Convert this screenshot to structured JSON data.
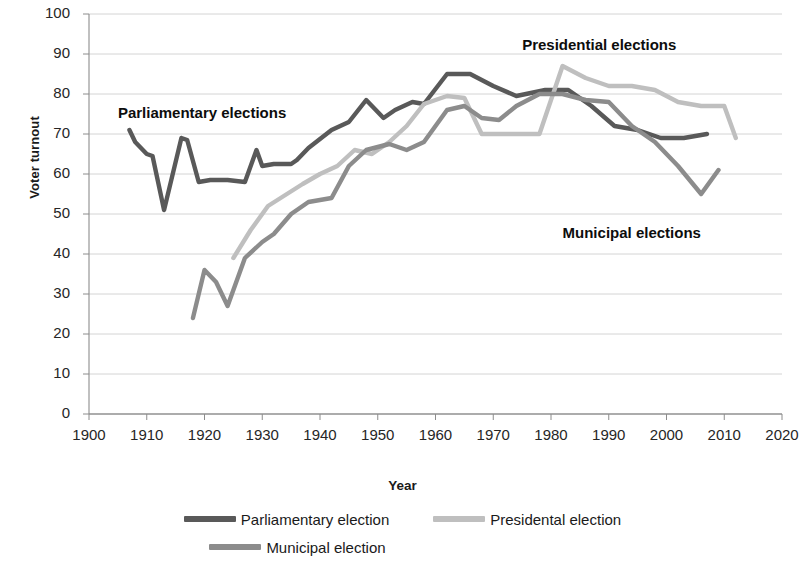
{
  "chart_data": {
    "type": "line",
    "title": "",
    "xlabel": "Year",
    "ylabel": "Voter turnout",
    "xlim": [
      1900,
      2020
    ],
    "ylim": [
      0,
      100
    ],
    "xticks": [
      "1900",
      "1910",
      "1920",
      "1930",
      "1940",
      "1950",
      "1960",
      "1970",
      "1980",
      "1990",
      "2000",
      "2010",
      "2020"
    ],
    "yticks": [
      "0",
      "10",
      "20",
      "30",
      "40",
      "50",
      "60",
      "70",
      "80",
      "90",
      "100"
    ],
    "grid": "horizontal",
    "legend_position": "bottom",
    "series": [
      {
        "name": "Parliamentary election",
        "color": "#595959",
        "x": [
          1907,
          1908,
          1910,
          1911,
          1913,
          1916,
          1917,
          1919,
          1921,
          1924,
          1927,
          1929,
          1930,
          1932,
          1935,
          1936,
          1938,
          1942,
          1945,
          1948,
          1951,
          1953,
          1956,
          1958,
          1962,
          1966,
          1970,
          1974,
          1979,
          1983,
          1987,
          1991,
          1995,
          1999,
          2003,
          2007
        ],
        "y": [
          71,
          68,
          65,
          64.5,
          51,
          69,
          68.5,
          58,
          58.5,
          58.5,
          58,
          66,
          62,
          62.5,
          62.5,
          63.5,
          66.5,
          71,
          73,
          78.5,
          74,
          76,
          78,
          77.5,
          85,
          85,
          82,
          79.5,
          81,
          81,
          77,
          72,
          71,
          69,
          69,
          70
        ]
      },
      {
        "name": "Presidental election",
        "color": "#bfbfbf",
        "x": [
          1925,
          1928,
          1931,
          1937,
          1940,
          1943,
          1946,
          1949,
          1952,
          1955,
          1958,
          1962,
          1965,
          1968,
          1971,
          1974,
          1978,
          1982,
          1986,
          1990,
          1994,
          1998,
          2002,
          2006,
          2010,
          2012
        ],
        "y": [
          39,
          46,
          52,
          57.5,
          60,
          62,
          66,
          65,
          68,
          72,
          77.5,
          79.5,
          79,
          70,
          70,
          70,
          70,
          87,
          84,
          82,
          82,
          81,
          78,
          77,
          77,
          69
        ]
      },
      {
        "name": "Municipal election",
        "color": "#8c8c8c",
        "x": [
          1918,
          1920,
          1922,
          1924,
          1927,
          1930,
          1932,
          1935,
          1938,
          1942,
          1945,
          1948,
          1952,
          1955,
          1958,
          1962,
          1965,
          1968,
          1971,
          1974,
          1978,
          1982,
          1986,
          1990,
          1994,
          1998,
          2002,
          2006,
          2009
        ],
        "y": [
          24,
          36,
          33,
          27,
          39,
          43,
          45,
          50,
          53,
          54,
          62,
          66,
          67.5,
          66,
          68,
          76,
          77,
          74,
          73.5,
          77,
          80,
          80,
          78.5,
          78,
          72,
          68,
          62,
          55,
          61
        ]
      }
    ],
    "annotations": [
      {
        "text": "Parliamentary elections",
        "x": 1905,
        "y": 75
      },
      {
        "text": "Presidential elections",
        "x": 1975,
        "y": 92
      },
      {
        "text": "Municipal elections",
        "x": 1982,
        "y": 45
      }
    ]
  },
  "axis": {
    "y_title": "Voter turnout",
    "x_title": "Year",
    "y_ticks": [
      "100",
      "90",
      "80",
      "70",
      "60",
      "50",
      "40",
      "30",
      "20",
      "10",
      "0"
    ],
    "x_ticks": [
      "1900",
      "1910",
      "1920",
      "1930",
      "1940",
      "1950",
      "1960",
      "1970",
      "1980",
      "1990",
      "2000",
      "2010",
      "2020"
    ]
  },
  "annotations": {
    "parliamentary": "Parliamentary elections",
    "presidential": "Presidential elections",
    "municipal": "Municipal elections"
  },
  "legend": {
    "items": [
      {
        "label": "Parliamentary election",
        "color": "#595959"
      },
      {
        "label": "Presidental election",
        "color": "#bfbfbf"
      },
      {
        "label": "Municipal election",
        "color": "#8c8c8c"
      }
    ]
  }
}
